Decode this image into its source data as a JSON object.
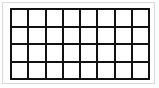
{
  "figure": {
    "name": "rectangular-grid",
    "columns": 8,
    "rows": 4,
    "total_cells": 32,
    "cell_label": "",
    "colors": {
      "background": "#ffffff",
      "grid_line": "#111111",
      "cell_fill": "#ffffff",
      "outer_frame": "#d8d8d8"
    },
    "geometry": {
      "canvas_width": 159,
      "canvas_height": 88,
      "grid_left": 10,
      "grid_top": 8,
      "grid_width": 140,
      "grid_height": 72,
      "line_thickness": 2
    },
    "cells": [
      [
        "",
        "",
        "",
        "",
        "",
        "",
        "",
        ""
      ],
      [
        "",
        "",
        "",
        "",
        "",
        "",
        "",
        ""
      ],
      [
        "",
        "",
        "",
        "",
        "",
        "",
        "",
        ""
      ],
      [
        "",
        "",
        "",
        "",
        "",
        "",
        "",
        ""
      ]
    ]
  }
}
